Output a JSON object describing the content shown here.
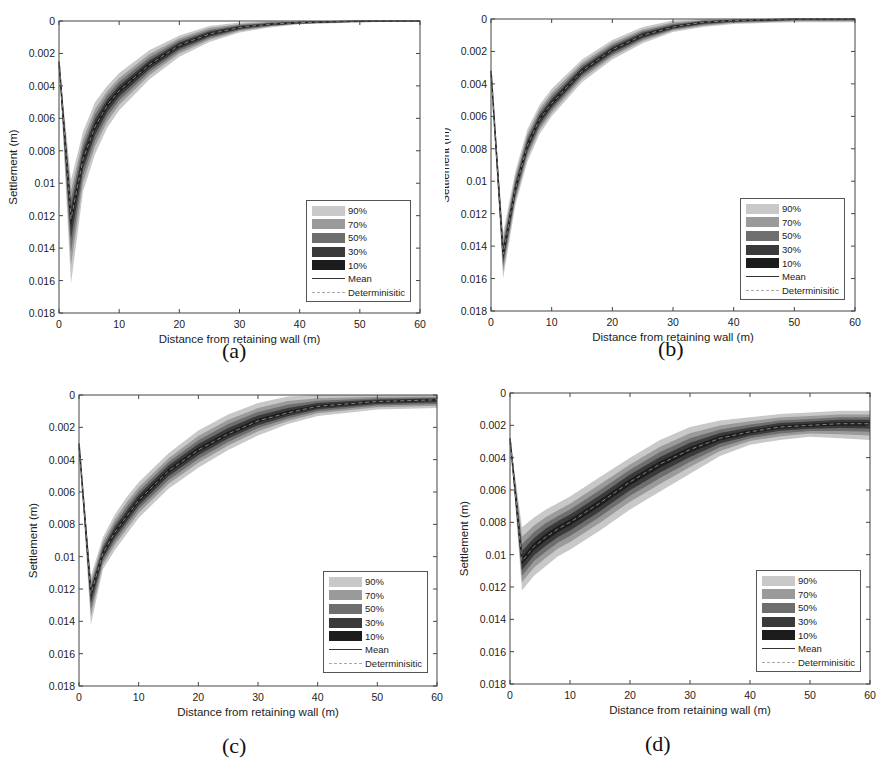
{
  "figure": {
    "captions": [
      "(a)",
      "(b)",
      "(c)",
      "(d)"
    ]
  },
  "legend": {
    "items": [
      {
        "label": "90%",
        "color": "#c8c8c8",
        "kind": "band"
      },
      {
        "label": "70%",
        "color": "#9a9a9a",
        "kind": "band"
      },
      {
        "label": "50%",
        "color": "#6e6e6e",
        "kind": "band"
      },
      {
        "label": "30%",
        "color": "#3a3a3a",
        "kind": "band"
      },
      {
        "label": "10%",
        "color": "#1c1c1c",
        "kind": "band"
      },
      {
        "label": "Mean",
        "color": "#333333",
        "kind": "solid"
      },
      {
        "label": "Determinisitic",
        "color": "#aaaaaa",
        "kind": "dashed"
      }
    ]
  },
  "axes": {
    "xlabel": "Distance from retaining wall (m)",
    "ylabel": "Settlement (m)",
    "xticks": [
      "0",
      "10",
      "20",
      "30",
      "40",
      "50",
      "60"
    ],
    "yticks": [
      "0",
      "0.002",
      "0.004",
      "0.006",
      "0.008",
      "0.01",
      "0.012",
      "0.014",
      "0.016",
      "0.018"
    ]
  },
  "chart_data": [
    {
      "id": "a",
      "type": "area",
      "title": "(a)",
      "xlabel": "Distance from retaining wall (m)",
      "ylabel": "Settlement (m)",
      "xlim": [
        0,
        60
      ],
      "ylim": [
        0.018,
        0
      ],
      "y_reversed": true,
      "grid": false,
      "legend_position": "lower right",
      "x": [
        0,
        2,
        4,
        6,
        8,
        10,
        15,
        20,
        25,
        30,
        35,
        40,
        50,
        60
      ],
      "series": [
        {
          "name": "Mean",
          "values": [
            0.0025,
            0.0122,
            0.0085,
            0.0065,
            0.0052,
            0.0043,
            0.0027,
            0.0015,
            0.0008,
            0.0004,
            0.0002,
            0.0001,
            0.0,
            0.0
          ]
        },
        {
          "name": "90% lower",
          "values": [
            0.0025,
            0.0098,
            0.0068,
            0.005,
            0.004,
            0.0032,
            0.0018,
            0.0009,
            0.0003,
            0.0001,
            0.0,
            0.0,
            0.0,
            0.0
          ]
        },
        {
          "name": "90% upper",
          "values": [
            0.0025,
            0.0162,
            0.0105,
            0.0082,
            0.0066,
            0.0055,
            0.0036,
            0.0022,
            0.0013,
            0.0007,
            0.0004,
            0.0002,
            0.0001,
            0.0
          ]
        }
      ]
    },
    {
      "id": "b",
      "type": "area",
      "title": "(b)",
      "xlabel": "Distance from retaining wall (m)",
      "ylabel": "Settlement (m)",
      "xlim": [
        0,
        60
      ],
      "ylim": [
        0.018,
        0
      ],
      "y_reversed": true,
      "grid": false,
      "legend_position": "lower right",
      "x": [
        0,
        2,
        4,
        6,
        8,
        10,
        15,
        20,
        25,
        30,
        35,
        40,
        50,
        60
      ],
      "series": [
        {
          "name": "Mean",
          "values": [
            0.0032,
            0.0145,
            0.0105,
            0.0078,
            0.0062,
            0.0052,
            0.0032,
            0.0019,
            0.001,
            0.0005,
            0.0002,
            0.0001,
            0.0,
            0.0
          ]
        },
        {
          "name": "90% lower",
          "values": [
            0.0032,
            0.0132,
            0.0094,
            0.0068,
            0.0053,
            0.0043,
            0.0025,
            0.0013,
            0.0005,
            0.0001,
            0.0,
            0.0,
            0.0,
            0.0
          ]
        },
        {
          "name": "90% upper",
          "values": [
            0.0032,
            0.016,
            0.0115,
            0.0088,
            0.0071,
            0.006,
            0.0039,
            0.0025,
            0.0015,
            0.0008,
            0.0005,
            0.0003,
            0.0002,
            0.0002
          ]
        }
      ]
    },
    {
      "id": "c",
      "type": "area",
      "title": "(c)",
      "xlabel": "Distance from retaining wall (m)",
      "ylabel": "Settlement (m)",
      "xlim": [
        0,
        60
      ],
      "ylim": [
        0.018,
        0
      ],
      "y_reversed": true,
      "grid": false,
      "legend_position": "lower right",
      "x": [
        0,
        2,
        4,
        6,
        8,
        10,
        15,
        20,
        25,
        30,
        35,
        40,
        50,
        60
      ],
      "series": [
        {
          "name": "Mean",
          "values": [
            0.003,
            0.0123,
            0.0098,
            0.0085,
            0.0075,
            0.0065,
            0.0047,
            0.0034,
            0.0024,
            0.0016,
            0.0011,
            0.0007,
            0.0004,
            0.0003
          ]
        },
        {
          "name": "90% lower",
          "values": [
            0.003,
            0.0112,
            0.0088,
            0.0074,
            0.0063,
            0.0054,
            0.0036,
            0.0022,
            0.0012,
            0.0005,
            0.0001,
            0.0,
            0.0,
            0.0
          ]
        },
        {
          "name": "90% upper",
          "values": [
            0.003,
            0.0142,
            0.0108,
            0.0096,
            0.0086,
            0.0076,
            0.0058,
            0.0045,
            0.0034,
            0.0025,
            0.0018,
            0.0013,
            0.0009,
            0.0008
          ]
        }
      ]
    },
    {
      "id": "d",
      "type": "area",
      "title": "(d)",
      "xlabel": "Distance from retaining wall (m)",
      "ylabel": "Settlement (m)",
      "xlim": [
        0,
        60
      ],
      "ylim": [
        0.018,
        0
      ],
      "y_reversed": true,
      "grid": false,
      "legend_position": "lower right",
      "x": [
        0,
        2,
        4,
        6,
        8,
        10,
        15,
        20,
        25,
        30,
        35,
        40,
        45,
        50,
        55,
        60
      ],
      "series": [
        {
          "name": "Mean",
          "values": [
            0.0028,
            0.0104,
            0.0095,
            0.0089,
            0.0084,
            0.008,
            0.0068,
            0.0055,
            0.0044,
            0.0035,
            0.0028,
            0.0024,
            0.0021,
            0.002,
            0.0019,
            0.0019
          ]
        },
        {
          "name": "90% lower",
          "values": [
            0.0028,
            0.0083,
            0.0077,
            0.0072,
            0.0068,
            0.0064,
            0.0052,
            0.004,
            0.0029,
            0.0021,
            0.0017,
            0.0015,
            0.0013,
            0.0012,
            0.0011,
            0.0011
          ]
        },
        {
          "name": "90% upper",
          "values": [
            0.0028,
            0.0122,
            0.0113,
            0.0107,
            0.0101,
            0.0097,
            0.0085,
            0.0072,
            0.0061,
            0.005,
            0.0039,
            0.0032,
            0.0029,
            0.0027,
            0.0028,
            0.0029
          ]
        }
      ]
    }
  ]
}
